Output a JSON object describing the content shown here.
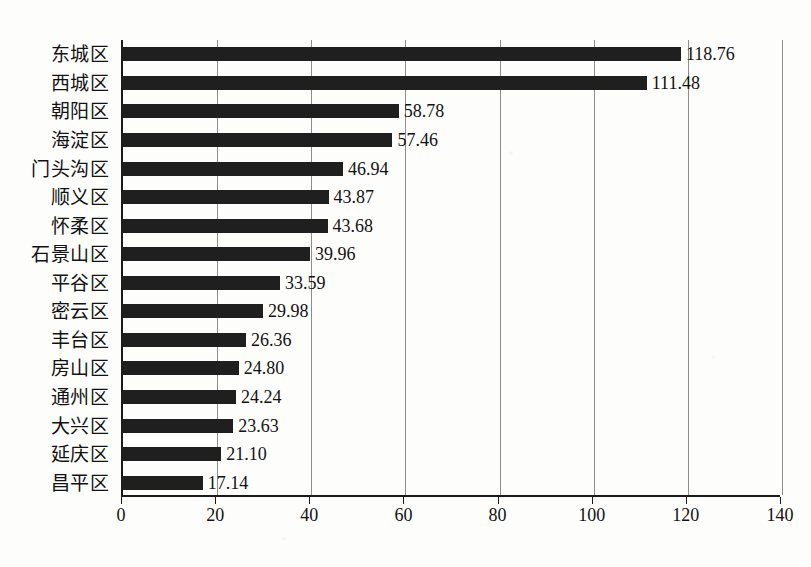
{
  "chart_data": {
    "type": "bar",
    "orientation": "horizontal",
    "title": "",
    "subtitle": "",
    "xlabel": "",
    "ylabel": "",
    "xlim": [
      0,
      140
    ],
    "ylim": null,
    "grid": true,
    "legend": null,
    "xticks": [
      0,
      20,
      40,
      60,
      80,
      100,
      120,
      140
    ],
    "xtick_labels": [
      "0",
      "20",
      "40",
      "60",
      "80",
      "100",
      "120",
      "140"
    ],
    "categories": [
      "东城区",
      "西城区",
      "朝阳区",
      "海淀区",
      "门头沟区",
      "顺义区",
      "怀柔区",
      "石景山区",
      "平谷区",
      "密云区",
      "丰台区",
      "房山区",
      "通州区",
      "大兴区",
      "延庆区",
      "昌平区"
    ],
    "values": [
      118.76,
      111.48,
      58.78,
      57.46,
      46.94,
      43.87,
      43.68,
      39.96,
      33.59,
      29.98,
      26.36,
      24.8,
      24.24,
      23.63,
      21.1,
      17.14
    ],
    "value_labels": [
      "118.76",
      "111.48",
      "58.78",
      "57.46",
      "46.94",
      "43.87",
      "43.68",
      "39.96",
      "33.59",
      "29.98",
      "26.36",
      "24.80",
      "24.24",
      "23.63",
      "21.10",
      "17.14"
    ],
    "series": [
      {
        "name": "",
        "values": [
          118.76,
          111.48,
          58.78,
          57.46,
          46.94,
          43.87,
          43.68,
          39.96,
          33.59,
          29.98,
          26.36,
          24.8,
          24.24,
          23.63,
          21.1,
          17.14
        ]
      }
    ],
    "colors": {
      "bar": "#1f1f1f",
      "axis": "#1a1a1a",
      "grid": "#8d8d8d",
      "text": "#121212",
      "background": "#fdfdfc"
    }
  }
}
